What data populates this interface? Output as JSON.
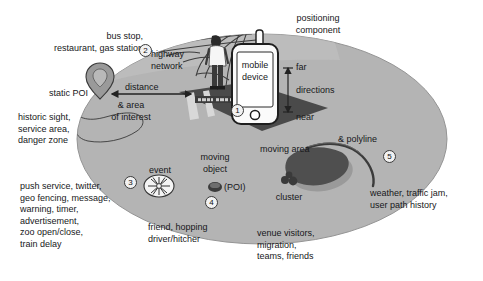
{
  "figure": {
    "background_color": "#ffffff",
    "ellipse_fill": "#b4b4b4",
    "ellipse_stroke": "#8f8f8f",
    "road_fill": "#4a4a4a",
    "blob_fill": "#4f4f4f"
  },
  "labels": {
    "positioning_component": "positioning\ncomponent",
    "mobile_device": "mobile\ndevice",
    "far": "far",
    "near": "near",
    "directions": "directions",
    "distance": "distance",
    "highway_network": "highway\nnetwork",
    "bus_stop": "bus stop,\nrestaurant, gas station",
    "static_poi": "static POI",
    "area_of_interest": "& area\nof interest",
    "historic_sight": "historic sight,\nservice area,\ndanger zone",
    "event": "event",
    "moving_object": "moving\nobject",
    "poi_paren": "(POI)",
    "cluster": "cluster",
    "moving_area": "moving area",
    "polyline": "& polyline",
    "push_service": "push service, twitter,\ngeo fencing, message,\nwarning, timer,\nadvertisement,\nzoo open/close,\ntrain delay",
    "friend_hopping": "friend, hopping\ndriver/hitcher",
    "venue_visitors": "venue visitors,\nmigration,\nteams, friends",
    "weather": "weather, traffic jam,\nuser path history",
    "street_sign": "Main Street"
  },
  "markers": {
    "m1": "1",
    "m2": "2",
    "m3": "3",
    "m4": "4",
    "m5": "5"
  },
  "icons": {
    "poi_pin": "map-pin-icon",
    "event_burst": "starburst-icon",
    "moving_dot": "filled-ellipse-icon",
    "cluster_group": "three-dots-cluster-icon",
    "person": "standing-person-icon",
    "phone": "mobile-phone-icon",
    "antenna": "antenna-icon"
  }
}
